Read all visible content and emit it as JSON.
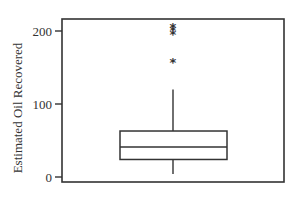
{
  "chart_data": {
    "type": "box",
    "title": "",
    "xlabel": "",
    "ylabel": "Estimated Oil Recovered",
    "ylim": [
      -5,
      220
    ],
    "yticks": [
      0,
      100,
      200
    ],
    "ytick_labels": [
      "0",
      "100",
      "200"
    ],
    "grid": false,
    "legend": null,
    "series": [
      {
        "name": "Estimated Oil Recovered",
        "whisker_low": 4,
        "q1": 24,
        "median": 41,
        "q3": 63,
        "whisker_high": 120,
        "outliers": [
          158,
          196,
          201,
          206
        ],
        "outlier_marker": "asterisk"
      }
    ]
  },
  "colors": {
    "line": "#333333",
    "background": "#ffffff"
  }
}
